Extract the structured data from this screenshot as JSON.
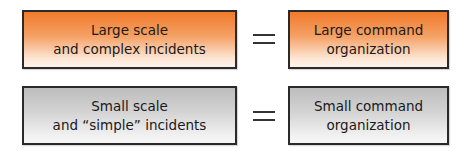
{
  "rows": [
    {
      "left": {
        "line1": "Large scale",
        "line2": "and complex incidents"
      },
      "operator": "=",
      "right": {
        "line1": "Large command",
        "line2": "organization"
      },
      "color": "#f07a2a"
    },
    {
      "left": {
        "line1": "Small scale",
        "line2": "and “simple” incidents"
      },
      "operator": "=",
      "right": {
        "line1": "Small command",
        "line2": "organization"
      },
      "color": "#bdbdbd"
    }
  ]
}
